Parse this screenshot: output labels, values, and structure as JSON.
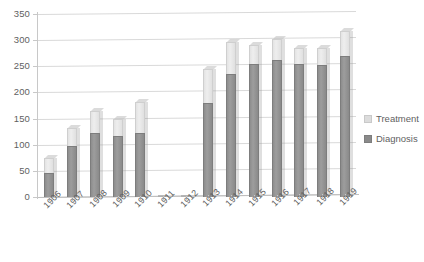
{
  "chart_data": {
    "type": "bar",
    "subtype": "stacked-bar",
    "title": "",
    "xlabel": "",
    "ylabel": "",
    "ylim": [
      0,
      350
    ],
    "ytick_step": 50,
    "yticks": [
      0,
      50,
      100,
      150,
      200,
      250,
      300,
      350
    ],
    "ytick_labels": [
      "0",
      "50",
      "100",
      "150",
      "200",
      "250",
      "300",
      "350"
    ],
    "grid": true,
    "legend_position": "right",
    "categories": [
      "1906",
      "1907",
      "1908",
      "1909",
      "1910",
      "1911",
      "1912",
      "1913",
      "1914",
      "1915",
      "1916",
      "1917",
      "1918",
      "1919"
    ],
    "series": [
      {
        "name": "Diagnosis",
        "color": "#8f8f8f",
        "values": [
          45,
          97,
          122,
          117,
          123,
          0,
          0,
          180,
          235,
          255,
          262,
          255,
          253,
          270
        ]
      },
      {
        "name": "Treatment",
        "color": "#e8e8e8",
        "values": [
          30,
          35,
          43,
          33,
          58,
          0,
          0,
          65,
          62,
          35,
          40,
          30,
          32,
          48
        ]
      }
    ],
    "totals": [
      75,
      132,
      165,
      150,
      181,
      0,
      0,
      245,
      297,
      290,
      302,
      285,
      285,
      318
    ]
  },
  "legend": {
    "items": [
      {
        "label": "Treatment",
        "color": "#dcdcdc"
      },
      {
        "label": "Diagnosis",
        "color": "#8a8a8a"
      }
    ]
  },
  "colors": {
    "gridline": "#d9d9d9",
    "axis": "#c0c0c0",
    "text": "#5f5f5f",
    "background": "#ffffff"
  }
}
